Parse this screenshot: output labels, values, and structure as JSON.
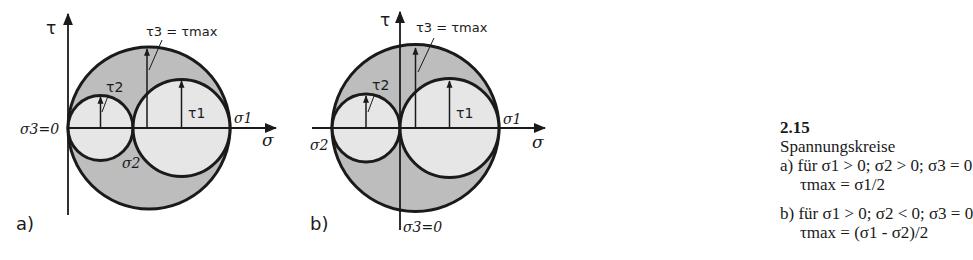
{
  "figure": {
    "number": "2.15",
    "title": "Spannungskreise",
    "items": [
      {
        "label": "a)",
        "condition": "für σ1 > 0; σ2 > 0; σ3 = 0",
        "result": "τmax = σ1/2"
      },
      {
        "label": "b)",
        "condition": "für σ1 > 0; σ2 < 0; σ3 = 0",
        "result": "τmax = (σ1 - σ2)/2"
      }
    ]
  },
  "diagrams": {
    "a": {
      "panel_label": "a)",
      "axis_tau": "τ",
      "axis_sigma": "σ",
      "origin_label": "σ3=0",
      "sigma1_label": "σ1",
      "sigma2_label": "σ2",
      "tau1_label": "τ1",
      "tau2_label": "τ2",
      "tau3_label": "τ3 = τmax"
    },
    "b": {
      "panel_label": "b)",
      "axis_tau": "τ",
      "axis_sigma": "σ",
      "origin_label": "σ3=0",
      "sigma1_label": "σ1",
      "sigma2_label": "σ2",
      "tau1_label": "τ1",
      "tau2_label": "τ2",
      "tau3_label": "τ3 = τmax"
    }
  },
  "colors": {
    "ink": "#1a1a1a",
    "outer_fill": "#bdbdbd",
    "inner_fill": "#e6e6e6",
    "background": "#ffffff"
  }
}
